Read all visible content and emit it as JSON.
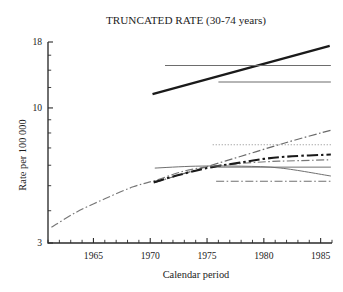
{
  "chart_data": {
    "type": "line",
    "title": "TRUNCATED RATE (30-74 years)",
    "xlabel": "Calendar period",
    "ylabel": "Rate per 100 000",
    "scale": "log-y",
    "xlim": [
      1961,
      1986
    ],
    "ylim": [
      3,
      18
    ],
    "grid": false,
    "legend": "none",
    "xticks": [
      1961,
      1962,
      1963,
      1964,
      1965,
      1966,
      1967,
      1968,
      1969,
      1970,
      1971,
      1972,
      1973,
      1974,
      1975,
      1976,
      1977,
      1978,
      1979,
      1980,
      1981,
      1982,
      1983,
      1984,
      1985,
      1986
    ],
    "xtick_labels": [
      "1965",
      "1970",
      "1975",
      "1980",
      "1985"
    ],
    "xtick_label_values": [
      1965,
      1970,
      1975,
      1980,
      1985
    ],
    "yticks_major": [
      3,
      10,
      18
    ],
    "ytick_labels": [
      "3",
      "10",
      "18"
    ],
    "yticks_minor": [
      4,
      5,
      6,
      7,
      8,
      9,
      12,
      14,
      16
    ],
    "series": [
      {
        "name": "upper-trend-observed",
        "style": "solid-thick-black",
        "color": "#1a1a1a",
        "width": 2.3,
        "x": [
          1970.2,
          1985.8
        ],
        "y": [
          11.3,
          17.4
        ]
      },
      {
        "name": "upper-level-high",
        "style": "solid-thin-gray",
        "color": "#6d6d6d",
        "width": 1.1,
        "x": [
          1971.3,
          1985.9
        ],
        "y": [
          14.6,
          14.6
        ]
      },
      {
        "name": "upper-level-mid",
        "style": "solid-thin-gray",
        "color": "#6d6d6d",
        "width": 1.1,
        "x": [
          1976.0,
          1985.9
        ],
        "y": [
          12.6,
          12.6
        ]
      },
      {
        "name": "lower-long-trend",
        "style": "dash-dot-gray",
        "color": "#777777",
        "width": 1.15,
        "x": [
          1961.3,
          1963.5,
          1966.0,
          1968.5,
          1970.5,
          1973.0,
          1975.5,
          1978.0,
          1980.5,
          1983.0,
          1985.9
        ],
        "y": [
          3.45,
          3.95,
          4.45,
          4.95,
          5.25,
          5.7,
          5.95,
          6.1,
          6.2,
          6.25,
          6.3
        ]
      },
      {
        "name": "lower-steep-projection",
        "style": "dash-dot-gray",
        "color": "#6a6a6a",
        "width": 1.2,
        "x": [
          1970.4,
          1974.0,
          1978.0,
          1982.0,
          1985.9
        ],
        "y": [
          5.15,
          5.75,
          6.5,
          7.35,
          8.2
        ]
      },
      {
        "name": "lower-dotted-level",
        "style": "dotted-gray",
        "color": "#8a8a8a",
        "width": 1.1,
        "x": [
          1975.5,
          1985.9
        ],
        "y": [
          7.2,
          7.2
        ]
      },
      {
        "name": "lower-trend-observed",
        "style": "dash-dot-thick-black",
        "color": "#1a1a1a",
        "width": 2.1,
        "x": [
          1970.3,
          1972.5,
          1975.0,
          1977.5,
          1980.0,
          1982.5,
          1985.9
        ],
        "y": [
          5.15,
          5.5,
          5.85,
          6.1,
          6.35,
          6.5,
          6.6
        ]
      },
      {
        "name": "lower-level-flat",
        "style": "solid-thin-gray",
        "color": "#707070",
        "width": 1.0,
        "x": [
          1970.4,
          1974.0,
          1978.0,
          1981.5,
          1985.9
        ],
        "y": [
          5.85,
          5.95,
          5.95,
          5.85,
          5.45
        ]
      },
      {
        "name": "lower-level-gray-flat2",
        "style": "solid-thin-gray",
        "color": "#707070",
        "width": 1.0,
        "x": [
          1976.0,
          1985.9
        ],
        "y": [
          5.9,
          5.9
        ]
      },
      {
        "name": "lower-level-dashdot-low",
        "style": "dash-dot-gray",
        "color": "#707070",
        "width": 1.1,
        "x": [
          1975.8,
          1985.9
        ],
        "y": [
          5.2,
          5.2
        ]
      }
    ]
  }
}
